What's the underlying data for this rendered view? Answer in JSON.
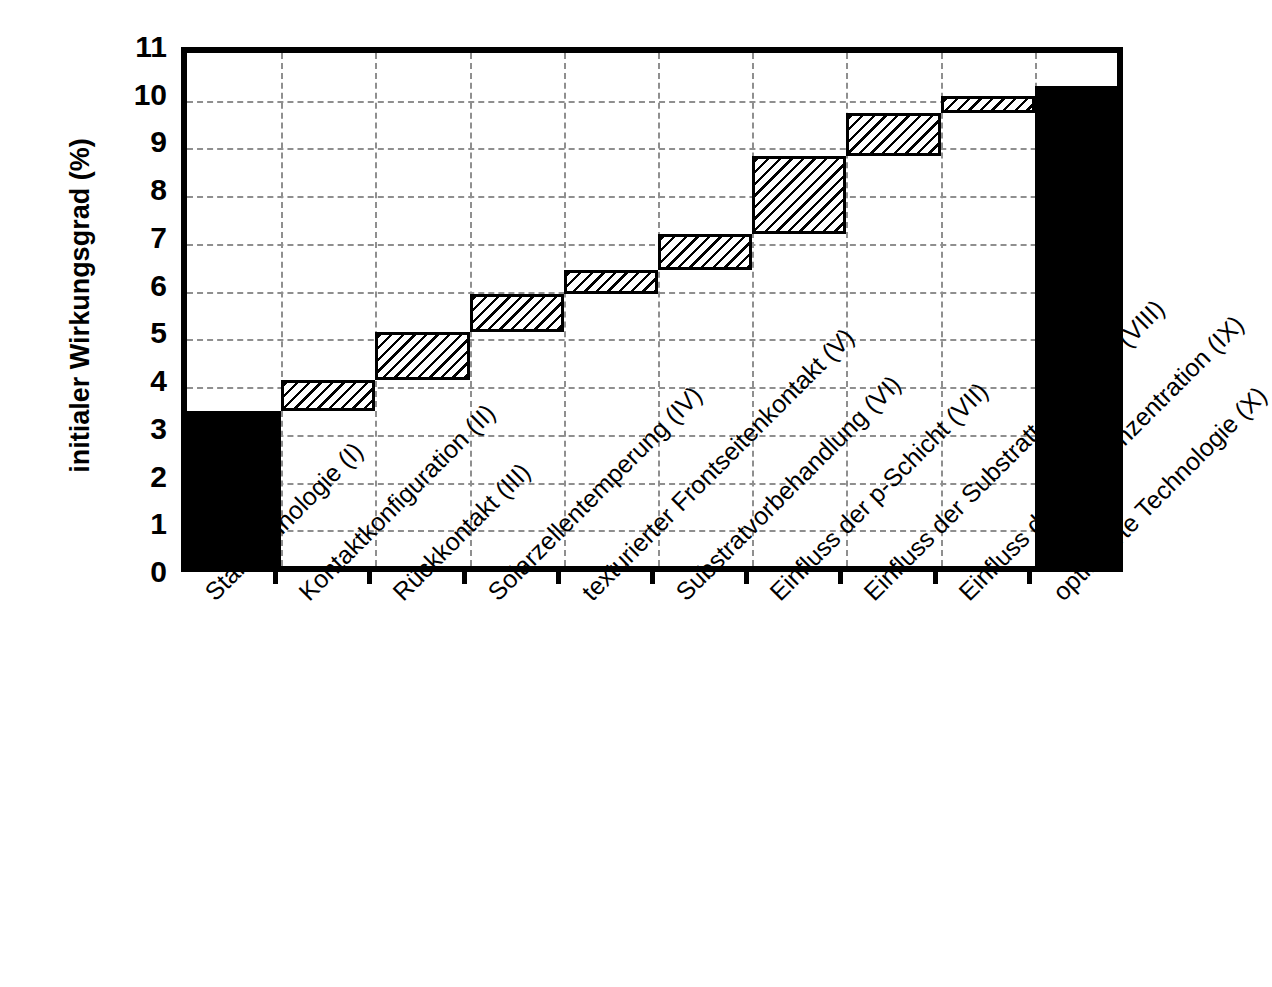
{
  "chart_data": {
    "type": "bar",
    "chart_subtype": "waterfall",
    "title": "",
    "xlabel": "",
    "ylabel": "initialer Wirkungsgrad (%)",
    "ylim": [
      0,
      11
    ],
    "ytick_labels": [
      "0",
      "1",
      "2",
      "3",
      "4",
      "5",
      "6",
      "7",
      "8",
      "9",
      "10",
      "11"
    ],
    "ytick_values": [
      0,
      1,
      2,
      3,
      4,
      5,
      6,
      7,
      8,
      9,
      10,
      11
    ],
    "grid": "horizontal-and-vertical-dashed",
    "legend": "none",
    "categories": [
      "Starttechnologie (I)",
      "Kontaktkonfiguration (II)",
      "Rückkontakt (III)",
      "Solarzellentemperung (IV)",
      "texturierter Frontseitenkontakt (V)",
      "Substratvorbehandlung (VI)",
      "Einfluss der p-Schicht (VII)",
      "Einfluss der Substrattemperatur (VIII)",
      "Einfluss der Silankonzentration (IX)",
      "optimierte Technologie (X)"
    ],
    "bars": [
      {
        "label": "Starttechnologie (I)",
        "base": 0.0,
        "top": 3.5,
        "delta": 3.5,
        "style": "solid"
      },
      {
        "label": "Kontaktkonfiguration (II)",
        "base": 3.5,
        "top": 4.15,
        "delta": 0.65,
        "style": "hatched"
      },
      {
        "label": "Rückkontakt (III)",
        "base": 4.15,
        "top": 5.15,
        "delta": 1.0,
        "style": "hatched"
      },
      {
        "label": "Solarzellentemperung (IV)",
        "base": 5.15,
        "top": 5.95,
        "delta": 0.8,
        "style": "hatched"
      },
      {
        "label": "texturierter Frontseitenkontakt (V)",
        "base": 5.95,
        "top": 6.45,
        "delta": 0.5,
        "style": "hatched"
      },
      {
        "label": "Substratvorbehandlung (VI)",
        "base": 6.45,
        "top": 7.2,
        "delta": 0.75,
        "style": "hatched"
      },
      {
        "label": "Einfluss der p-Schicht (VII)",
        "base": 7.2,
        "top": 8.85,
        "delta": 1.65,
        "style": "hatched"
      },
      {
        "label": "Einfluss der Substrattemperatur (VIII)",
        "base": 8.85,
        "top": 9.75,
        "delta": 0.9,
        "style": "hatched"
      },
      {
        "label": "Einfluss der Silankonzentration (IX)",
        "base": 9.75,
        "top": 10.1,
        "delta": 0.35,
        "style": "hatched"
      },
      {
        "label": "optimierte Technologie (X)",
        "base": 0.0,
        "top": 10.3,
        "delta": 10.3,
        "style": "solid"
      }
    ],
    "colors": {
      "solid_bar": "#000000",
      "hatch_line": "#000000",
      "hatch_background": "#ffffff",
      "axis": "#000000",
      "gridline": "#8f8f8f",
      "plot_background": "#ffffff"
    }
  }
}
